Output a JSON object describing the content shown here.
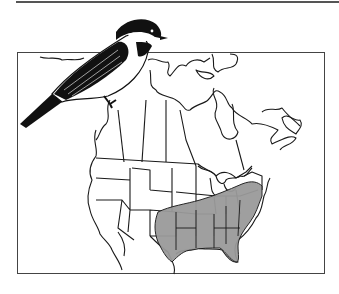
{
  "figure": {
    "type": "species-range-map",
    "region": "North America",
    "range_area": "southeastern United States",
    "colors": {
      "outline": "#1a1a1a",
      "range_fill": "#9a9a9a",
      "frame": "#444444",
      "bird_black": "#111111",
      "background": "#ffffff"
    }
  }
}
